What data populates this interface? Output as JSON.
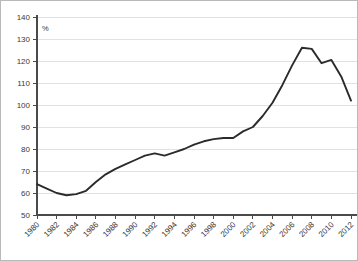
{
  "chart_data": {
    "type": "line",
    "title": "",
    "subtitle": "",
    "xlabel": "",
    "ylabel": "",
    "unit_label": "%",
    "grid": true,
    "legend": false,
    "legend_position": "none",
    "xlim": [
      1980,
      2012
    ],
    "ylim": [
      50,
      140
    ],
    "y_ticks": [
      50,
      60,
      70,
      80,
      90,
      100,
      110,
      120,
      130,
      140
    ],
    "x_ticks": [
      1980,
      1982,
      1984,
      1986,
      1988,
      1990,
      1992,
      1994,
      1996,
      1998,
      2000,
      2002,
      2004,
      2006,
      2008,
      2010,
      2012
    ],
    "x_tick_labels": [
      "1980",
      "1982",
      "1984",
      "1986",
      "1988",
      "1990",
      "1992",
      "1994",
      "1996",
      "1998",
      "2000",
      "2002",
      "2004",
      "2006",
      "2008",
      "2010",
      "2012"
    ],
    "y_tick_labels": [
      "50",
      "60",
      "70",
      "80",
      "90",
      "100",
      "110",
      "120",
      "130",
      "140"
    ],
    "line_color": "#2b2b2b",
    "grid_color": "#e2e2e2",
    "axis_color": "#4a4a4a",
    "series": [
      {
        "name": "",
        "x": [
          1980,
          1981,
          1982,
          1983,
          1984,
          1985,
          1986,
          1987,
          1988,
          1989,
          1990,
          1991,
          1992,
          1993,
          1994,
          1995,
          1996,
          1997,
          1998,
          1999,
          2000,
          2001,
          2002,
          2003,
          2004,
          2005,
          2006,
          2007,
          2008,
          2009,
          2010,
          2011,
          2012
        ],
        "values": [
          64,
          62,
          60,
          59,
          59.5,
          61,
          65,
          68.5,
          71,
          73,
          75,
          77,
          78,
          77,
          78.5,
          80,
          82,
          83.5,
          84.5,
          85,
          85,
          88,
          90,
          95,
          101,
          109,
          118,
          126,
          125.5,
          119,
          120.5,
          113,
          102
        ]
      }
    ]
  }
}
